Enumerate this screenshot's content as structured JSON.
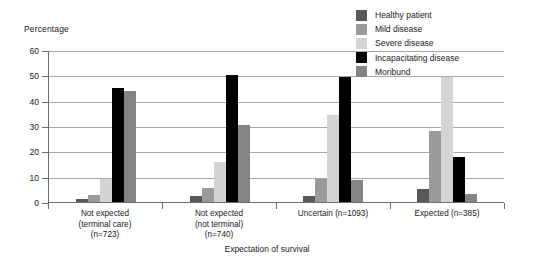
{
  "chart_data": {
    "type": "bar",
    "title": "",
    "ylabel": "Percentage",
    "xlabel": "Expectation of survival",
    "ylim": [
      0,
      60
    ],
    "yticks": [
      0,
      10,
      20,
      30,
      40,
      50,
      60
    ],
    "grid": true,
    "legend_position": "top-right",
    "categories": [
      "Not expected\n(terminal care)\n(n=723)",
      "Not expected\n(not terminal)\n(n=740)",
      "Uncertain (n=1093)",
      "Expected (n=385)"
    ],
    "category_lines": [
      [
        "Not expected",
        "(terminal care)",
        "(n=723)"
      ],
      [
        "Not expected",
        "(not terminal)",
        "(n=740)"
      ],
      [
        "Uncertain (n=1093)"
      ],
      [
        "Expected (n=385)"
      ]
    ],
    "series": [
      {
        "name": "Healthy patient",
        "color": "#595959",
        "values": [
          1.3,
          2.2,
          2.4,
          5.0
        ]
      },
      {
        "name": "Mild disease",
        "color": "#9a9a9a",
        "values": [
          2.8,
          5.5,
          9.0,
          28.0
        ]
      },
      {
        "name": "Severe disease",
        "color": "#d4d4d4",
        "values": [
          9.0,
          15.7,
          34.5,
          49.5
        ]
      },
      {
        "name": "Incapacitating disease",
        "color": "#000000",
        "values": [
          45.2,
          50.3,
          49.4,
          17.9
        ]
      },
      {
        "name": "Moribund",
        "color": "#848484",
        "values": [
          43.7,
          30.3,
          8.8,
          3.0
        ]
      }
    ]
  }
}
